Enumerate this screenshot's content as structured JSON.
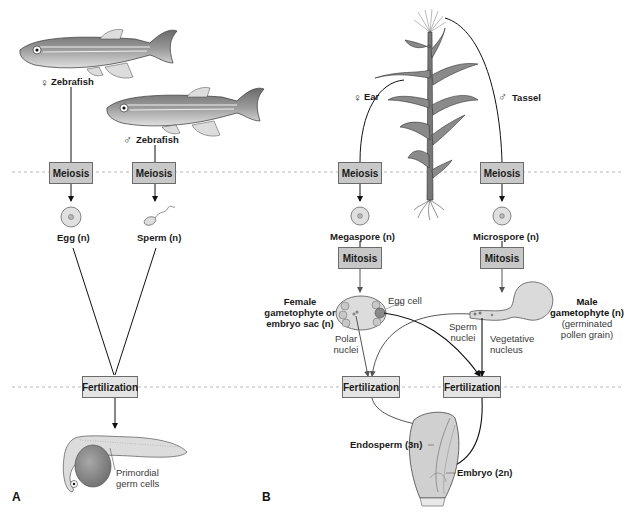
{
  "panel_a": {
    "label": "A",
    "female_parent": {
      "symbol": "♀",
      "name": "Zebrafish"
    },
    "male_parent": {
      "symbol": "♂",
      "name": "Zebrafish"
    },
    "meiosis_labels": [
      "Meiosis",
      "Meiosis"
    ],
    "egg_label": "Egg (n)",
    "sperm_label": "Sperm (n)",
    "fertilization_label": "Fertilization",
    "embryo_annotation": "Primordial\ngerm cells",
    "embryo_annotation_lines": [
      "Primordial",
      "germ cells"
    ]
  },
  "panel_b": {
    "label": "B",
    "female_parent": {
      "symbol": "♀",
      "name": "Ear"
    },
    "male_parent": {
      "symbol": "♂",
      "name": "Tassel"
    },
    "meiosis_labels": [
      "Meiosis",
      "Meiosis"
    ],
    "megaspore_label": "Megaspore (n)",
    "microspore_label": "Microspore (n)",
    "mitosis_labels": [
      "Mitosis",
      "Mitosis"
    ],
    "female_gametophyte_lines": [
      "Female",
      "gametophyte or",
      "embryo sac (n)"
    ],
    "egg_cell_label": "Egg cell",
    "polar_nuclei_lines": [
      "Polar",
      "nuclei"
    ],
    "sperm_nuclei_lines": [
      "Sperm",
      "nuclei"
    ],
    "vegetative_nucleus_lines": [
      "Vegetative",
      "nucleus"
    ],
    "male_gametophyte_lines": [
      "Male",
      "gametophyte (n)"
    ],
    "male_gametophyte_sub_lines": [
      "(germinated",
      "pollen grain)"
    ],
    "fertilization_labels": [
      "Fertilization",
      "Fertilization"
    ],
    "endosperm_label": "Endosperm (3n)",
    "embryo_label": "Embryo (2n)"
  },
  "colors": {
    "meiosis_box": "#c8c8c8",
    "fertilization_box": "#e4e4e4",
    "dashed_line": "#9a9a9a",
    "arrow": "#111111",
    "secondary_arrow": "#555555"
  }
}
